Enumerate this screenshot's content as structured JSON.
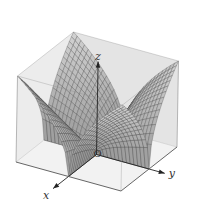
{
  "chart_data": {
    "type": "surface3d",
    "title": "",
    "function": "z = sqrt(|x*y|)",
    "x_range": [
      -1,
      1
    ],
    "y_range": [
      -1,
      1
    ],
    "z_range": [
      0,
      1
    ],
    "mesh_divisions": 28,
    "axis_labels": {
      "x": "x",
      "y": "y",
      "z": "z"
    },
    "origin_label": "O",
    "box": true,
    "grid": false,
    "legend": "none",
    "colors": {
      "surface_fill": "#bdbdbd",
      "mesh_line": "#3a3a3a",
      "box_face": "#ececec",
      "box_edge": "#8a8a8a",
      "axis": "#222222"
    }
  }
}
